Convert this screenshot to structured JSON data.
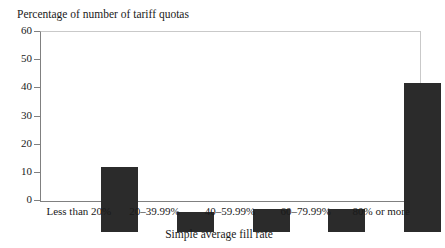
{
  "chart_data": {
    "type": "bar",
    "title": "Percentage of number of tariff quotas",
    "xlabel": "Simple average fill rate",
    "ylabel": "",
    "categories": [
      "Less than 20%",
      "20–39.99%",
      "40–59.99%",
      "60–79.99%",
      "80% or more"
    ],
    "values": [
      23.2,
      7.2,
      8.1,
      8.1,
      53.2
    ],
    "ylim": [
      0,
      60
    ],
    "yticks": [
      0,
      10,
      20,
      30,
      40,
      50,
      60
    ],
    "ytick_labels": [
      "0",
      "10",
      "20",
      "30",
      "40",
      "50",
      "60"
    ],
    "grid": false,
    "legend": false,
    "bar_color": "#2b2b2b",
    "axis_color": "#808080",
    "frame_color": "#c9c9c9",
    "background": "#ffffff"
  }
}
